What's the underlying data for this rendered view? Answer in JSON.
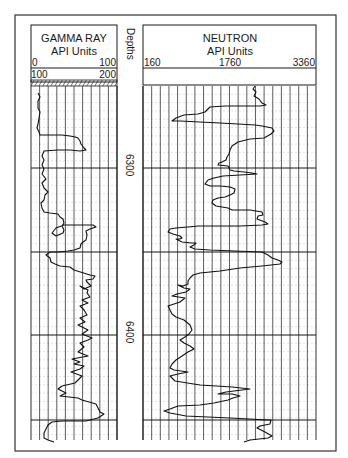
{
  "chart_data": {
    "type": "line",
    "tracks": [
      {
        "name": "GAMMA RAY",
        "units": "API Units",
        "scale_primary": {
          "min_label": "0",
          "max_label": "100",
          "min": 0,
          "max": 100
        },
        "scale_backup": {
          "min_label": "100",
          "max_label": "200",
          "min": 100,
          "max": 200
        },
        "grid_divisions": 10
      },
      {
        "name": "Depths",
        "depth_labels": [
          {
            "value": "6300",
            "y": 168
          },
          {
            "value": "6400",
            "y": 335
          }
        ]
      },
      {
        "name": "NEUTRON",
        "units": "API Units",
        "scale": {
          "min_label": "160",
          "mid_label": "1760",
          "max_label": "3360",
          "min": 160,
          "max": 3360
        },
        "grid_divisions": 20
      }
    ],
    "depth_range_approx": [
      6255,
      6465
    ],
    "major_depth_lines_y": [
      168,
      252,
      335,
      420
    ],
    "series": [
      {
        "name": "Gamma Ray",
        "points": "38,93 40,97 38,101 38,108 40,112 39,118 38,124 37,128 39,132 40,135 62,135 70,136 75,137 78,138 80,141 81,144 84,148 86,150 80,151 70,150 58,150 44,151 42,156 44,160 42,165 44,169 42,174 46,179 42,183 44,188 48,192 45,195 44,200 41,203 42,208 44,212 50,213 58,214 60,217 63,219 64,223 62,226 64,230 63,233 56,236 52,233 56,228 64,225 72,225 85,225 93,225 96,227 90,229 86,231 87,235 86,240 83,242 81,244 80,248 74,250 68,251 58,252 50,252 46,255 50,258 51,262 55,264 60,266 70,267 74,270 90,275 95,276 93,279 86,280 87,282 91,286 84,289 80,286 88,290 87,293 90,297 82,300 88,303 80,306 84,310 87,315 80,318 85,322 78,325 88,330 82,334 92,338 88,340 80,343 84,347 78,352 88,356 72,359 80,362 74,364 84,366 80,369 71,372 82,376 78,380 75,383 62,386 58,389 66,393 60,396 78,398 82,400 96,404 98,408 100,412 104,414 98,418 86,421 62,421 52,422 48,425 46,429 44,433 44,438 48,440 54,442"
      },
      {
        "name": "Neutron",
        "points": "255,86 253,89 256,92 254,96 259,99 262,103 266,105 260,106 250,106 225,106 210,107 207,110 205,112 198,114 184,115 176,118 172,121 180,121 200,122 220,123 238,124 255,125 262,126 272,128 274,131 271,134 264,138 250,139 238,142 232,146 230,150 229,154 227,157 226,160 222,162 219,163 218,165 228,166 230,170 234,171 244,172 252,173 257,174 240,175 223,176 214,178 208,180 205,184 210,186 220,186 230,187 235,189 234,193 230,195 225,197 218,198 213,200 212,203 216,206 222,207 228,208 232,210 250,210 256,211 262,212 263,215 258,216 257,219 265,222 268,224 262,225 240,226 218,226 198,226 188,227 176,228 170,229 168,232 173,234 180,236 182,238 180,239 176,239 182,242 192,243 196,243 194,245 190,247 195,249 210,250 235,251 262,252 268,255 272,258 278,260 282,262 280,264 262,266 240,268 220,271 200,273 193,275 190,278 188,281 188,284 183,286 178,285 184,288 190,289 186,292 177,294 172,296 185,298 180,302 168,306 170,310 172,314 176,317 184,320 190,325 192,330 189,334 185,337 180,340 184,343 190,346 194,349 188,352 182,356 176,360 172,364 170,368 174,370 188,372 178,374 170,376 175,381 200,385 232,387 250,389 226,392 218,394 232,394 240,396 233,398 228,400 214,403 200,405 178,406 170,409 164,411 170,413 186,416 230,418 268,420 271,420 270,424 260,426 257,428 265,432 272,436 268,438 250,440 244,442"
      }
    ]
  },
  "header": {
    "gamma": {
      "title": "GAMMA RAY",
      "units": "API Units",
      "left": "0",
      "right": "100",
      "left2": "100",
      "right2": "200"
    },
    "depth": {
      "title": "Depths"
    },
    "neutron": {
      "title": "NEUTRON",
      "units": "API Units",
      "left": "160",
      "mid": "1760",
      "right": "3360"
    }
  },
  "colors": {
    "ink": "#1a1a1a",
    "grid": "#333333",
    "minor_grid": "#c8c8c8",
    "background": "#ffffff"
  }
}
